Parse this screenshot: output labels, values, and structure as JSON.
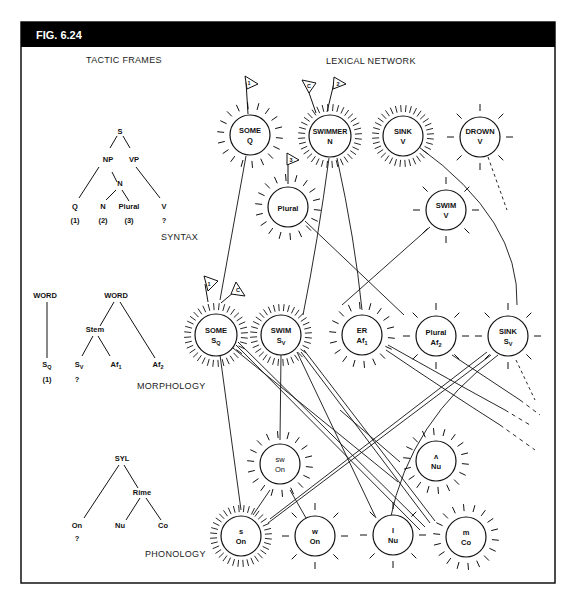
{
  "figure": {
    "label": "FIG. 6.24",
    "colors": {
      "header_bg": "#000000",
      "header_text": "#ffffff",
      "ink": "#111111",
      "background": "#ffffff"
    }
  },
  "sections": {
    "tactic_frames": "TACTIC FRAMES",
    "lexical_network": "LEXICAL NETWORK",
    "syntax": "SYNTAX",
    "morphology": "MORPHOLOGY",
    "phonology": "PHONOLOGY"
  },
  "syntax_tree": {
    "nodes": {
      "S": "S",
      "NP": "NP",
      "VP": "VP",
      "N_mid": "N",
      "Q": "Q",
      "N": "N",
      "Plural": "Plural",
      "V": "V"
    },
    "slots": {
      "q": "(1)",
      "n": "(2)",
      "plural": "(3)",
      "v": "?"
    }
  },
  "morphology_trees": {
    "tree1": {
      "root": "WORD",
      "leaf_main": "S",
      "leaf_sub": "Q",
      "slot": "(1)"
    },
    "tree2": {
      "root": "WORD",
      "stem": "Stem",
      "sv_main": "S",
      "sv_sub": "V",
      "af1_main": "Af",
      "af1_sub": "1",
      "af2_main": "Af",
      "af2_sub": "2",
      "slot": "?"
    }
  },
  "phonology_tree": {
    "root": "SYL",
    "rime": "Rime",
    "on": "On",
    "nu": "Nu",
    "co": "Co",
    "slot": "?"
  },
  "network_nodes": {
    "some_q": {
      "line1": "SOME",
      "line2": "Q",
      "activation": "medium",
      "flag": "1"
    },
    "swimmer_n": {
      "line1": "SWIMMER",
      "line2": "N",
      "activation": "high",
      "flags": [
        "C",
        "2"
      ]
    },
    "sink_v": {
      "line1": "SINK",
      "line2": "V",
      "activation": "high"
    },
    "drown_v": {
      "line1": "DROWN",
      "line2": "V",
      "activation": "low"
    },
    "plural": {
      "line1": "Plural",
      "activation": "medium",
      "flag": "3"
    },
    "swim_v": {
      "line1": "SWIM",
      "line2": "V",
      "activation": "low"
    },
    "some_sq": {
      "line1": "SOME",
      "line2_main": "S",
      "line2_sub": "Q",
      "activation": "high",
      "flags": [
        "1",
        "C"
      ]
    },
    "swim_sv": {
      "line1": "SWIM",
      "line2_main": "S",
      "line2_sub": "V",
      "activation": "high"
    },
    "er_af1": {
      "line1": "ER",
      "line2_main": "Af",
      "line2_sub": "1",
      "activation": "medium"
    },
    "plural_af2": {
      "line1": "Plural",
      "line2_main": "Af",
      "line2_sub": "2",
      "activation": "low"
    },
    "sink_sv": {
      "line1": "SINK",
      "line2_main": "S",
      "line2_sub": "V",
      "activation": "low"
    },
    "sw_on": {
      "line1": "sw",
      "line2": "On",
      "activation": "medium"
    },
    "caret_nu": {
      "line1": "ʌ",
      "line2": "Nu",
      "activation": "medium"
    },
    "s_on": {
      "line1": "s",
      "line2": "On",
      "activation": "high"
    },
    "w_on": {
      "line1": "w",
      "line2": "On",
      "activation": "low"
    },
    "i_nu": {
      "line1": "I",
      "line2": "Nu",
      "activation": "low"
    },
    "m_co": {
      "line1": "m",
      "line2": "Co",
      "activation": "medium"
    }
  }
}
